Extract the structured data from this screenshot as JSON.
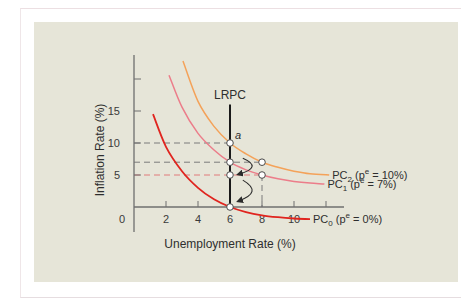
{
  "colors": {
    "panel_bg": "#e6e5d8",
    "axis": "#6f6f6f",
    "lrpc": "#1a1a1a",
    "pc0": "#e0251f",
    "pc1": "#ec7d8a",
    "pc2": "#f4a259",
    "dash_gray": "#7a7a7a",
    "dash_pink": "#e07a7a",
    "arrow": "#2a2a2a"
  },
  "chart_data": {
    "type": "line",
    "title": "",
    "xlabel": "Unemployment Rate (%)",
    "ylabel": "Inflation Rate (%)",
    "xlim": [
      0,
      13
    ],
    "ylim": [
      0,
      24
    ],
    "x_ticks": [
      {
        "value": 2,
        "label": "2"
      },
      {
        "value": 4,
        "label": "4"
      },
      {
        "value": 6,
        "label": "6"
      },
      {
        "value": 8,
        "label": "8"
      },
      {
        "value": 10,
        "label": "10"
      },
      {
        "value": 12,
        "label": ""
      }
    ],
    "y_ticks": [
      {
        "value": 5,
        "label": "5"
      },
      {
        "value": 10,
        "label": "10"
      },
      {
        "value": 15,
        "label": "15"
      },
      {
        "value": 20,
        "label": ""
      }
    ],
    "origin_label": "0",
    "grid": false,
    "legend": "none",
    "vertical_line": {
      "name": "LRPC",
      "label": "LRPC",
      "x": 6,
      "y_range": [
        0,
        16
      ]
    },
    "series": [
      {
        "name": "PC2",
        "label_main": "PC",
        "label_sub": "2",
        "label_rest_pre": " (p",
        "label_sup": "e",
        "label_rest_post": " = 10%)",
        "color_key": "pc2",
        "points": [
          [
            3.06,
            22.8
          ],
          [
            4.0,
            16.5
          ],
          [
            5.0,
            12.6
          ],
          [
            6.0,
            10.0
          ],
          [
            7.0,
            8.3
          ],
          [
            8.0,
            7.0
          ],
          [
            9.0,
            6.2
          ],
          [
            10.0,
            5.6
          ],
          [
            11.0,
            5.2
          ],
          [
            12.2,
            5.0
          ]
        ]
      },
      {
        "name": "PC1",
        "label_main": "PC",
        "label_sub": "1",
        "label_rest_pre": " (p",
        "label_sup": "e",
        "label_rest_post": " = 7%)",
        "color_key": "pc1",
        "points": [
          [
            2.19,
            20.6
          ],
          [
            3.0,
            15.6
          ],
          [
            4.0,
            11.5
          ],
          [
            5.0,
            8.9
          ],
          [
            6.0,
            7.0
          ],
          [
            7.0,
            5.8
          ],
          [
            8.0,
            5.0
          ],
          [
            9.0,
            4.4
          ],
          [
            10.0,
            4.0
          ],
          [
            11.0,
            3.75
          ],
          [
            11.9,
            3.6
          ]
        ]
      },
      {
        "name": "PC0",
        "label_main": "PC",
        "label_sub": "0",
        "label_rest_pre": " (p",
        "label_sup": "e",
        "label_rest_post": " = 0%)",
        "color_key": "pc0",
        "points": [
          [
            1.19,
            14.5
          ],
          [
            2.0,
            9.4
          ],
          [
            3.0,
            5.6
          ],
          [
            4.0,
            3.0
          ],
          [
            5.0,
            1.2
          ],
          [
            6.0,
            0.0
          ],
          [
            7.0,
            -0.8
          ],
          [
            8.0,
            -1.3
          ],
          [
            9.0,
            -1.6
          ],
          [
            10.0,
            -1.8
          ],
          [
            11.0,
            -1.9
          ]
        ]
      }
    ],
    "points": [
      {
        "name": "a",
        "x": 6,
        "y": 10,
        "label": "a"
      },
      {
        "name": "p-6-7",
        "x": 6,
        "y": 7,
        "label": ""
      },
      {
        "name": "p-6-5",
        "x": 6,
        "y": 5,
        "label": ""
      },
      {
        "name": "p-6-0",
        "x": 6,
        "y": 0,
        "label": ""
      },
      {
        "name": "p-8-7",
        "x": 8,
        "y": 7,
        "label": ""
      },
      {
        "name": "p-8-5",
        "x": 8,
        "y": 5,
        "label": ""
      }
    ],
    "dashed_lines": [
      {
        "name": "dash-10",
        "from": [
          0,
          10
        ],
        "to": [
          6,
          10
        ],
        "color_key": "dash_gray"
      },
      {
        "name": "dash-7",
        "from": [
          0,
          7
        ],
        "to": [
          8,
          7
        ],
        "color_key": "dash_gray"
      },
      {
        "name": "dash-5",
        "from": [
          0,
          5
        ],
        "to": [
          8,
          5
        ],
        "color_key": "dash_pink"
      },
      {
        "name": "dash-8-vertical",
        "from": [
          8,
          5
        ],
        "to": [
          8,
          0
        ],
        "color_key": "dash_gray"
      }
    ],
    "arrows": [
      {
        "name": "arrow-upper",
        "from": [
          6.8,
          7.6
        ],
        "ctrl": [
          8.1,
          6.2
        ],
        "to": [
          6.5,
          5.1
        ]
      },
      {
        "name": "arrow-lower",
        "from": [
          6.8,
          4.2
        ],
        "ctrl": [
          8.1,
          2.3
        ],
        "to": [
          6.5,
          0.9
        ]
      }
    ]
  }
}
